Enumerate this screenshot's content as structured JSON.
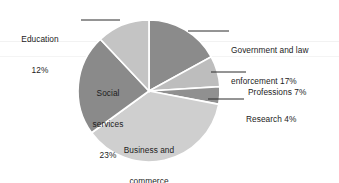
{
  "chart_data": {
    "type": "pie",
    "title": "",
    "subtitle": "",
    "xlabel": "",
    "ylabel": "",
    "legend_position": "none",
    "grid": false,
    "label_style": "category name with percentage",
    "total_percent": 100,
    "categories": [
      "Government and law enforcement",
      "Professions",
      "Research",
      "Business and commerce",
      "Social services",
      "Education"
    ],
    "values": [
      17,
      7,
      4,
      37,
      23,
      12
    ],
    "slices": [
      {
        "name": "Government and law enforcement",
        "value": 17,
        "value_text": "17%",
        "label_line_1": "Government and law",
        "label_line_2": "enforcement 17%",
        "color": "#8b8b8b",
        "label_placement": "outside-right",
        "start_angle_deg": 0,
        "end_angle_deg": 61.2
      },
      {
        "name": "Professions",
        "value": 7,
        "value_text": "7%",
        "label_line_1": "Professions 7%",
        "label_line_2": "",
        "color": "#bdbdbd",
        "label_placement": "outside-right",
        "start_angle_deg": 61.2,
        "end_angle_deg": 86.4
      },
      {
        "name": "Research",
        "value": 4,
        "value_text": "4%",
        "label_line_1": "Research 4%",
        "label_line_2": "",
        "color": "#909090",
        "label_placement": "outside-right",
        "start_angle_deg": 86.4,
        "end_angle_deg": 100.8
      },
      {
        "name": "Business and commerce",
        "value": 37,
        "value_text": "37%",
        "label_line_1": "Business and",
        "label_line_2": "commerce",
        "label_line_3": "37%",
        "color": "#cfcfcf",
        "label_placement": "inside",
        "start_angle_deg": 100.8,
        "end_angle_deg": 234.0
      },
      {
        "name": "Social services",
        "value": 23,
        "value_text": "23%",
        "label_line_1": "Social",
        "label_line_2": "services",
        "label_line_3": "23%",
        "color": "#8a8a8a",
        "label_placement": "inside",
        "start_angle_deg": 234.0,
        "end_angle_deg": 316.8
      },
      {
        "name": "Education",
        "value": 12,
        "value_text": "12%",
        "label_line_1": "Education",
        "label_line_2": "12%",
        "color": "#c4c4c4",
        "label_placement": "outside-left",
        "start_angle_deg": 316.8,
        "end_angle_deg": 360.0
      }
    ],
    "geometry": {
      "center_x": 149,
      "center_y": 91,
      "radius": 71,
      "separator_color": "#ffffff"
    },
    "background_color": "#ffffff",
    "text_color": "#1c1c1c"
  },
  "labels": {
    "education": {
      "line1": "Education",
      "line2": "12%"
    },
    "government": {
      "line1": "Government and law",
      "line2": "enforcement 17%"
    },
    "professions": {
      "line1": "Professions 7%"
    },
    "research": {
      "line1": "Research 4%"
    },
    "social_services": {
      "line1": "Social",
      "line2": "services",
      "line3": "23%"
    },
    "business": {
      "line1": "Business and",
      "line2": "commerce",
      "line3": "37%"
    }
  }
}
